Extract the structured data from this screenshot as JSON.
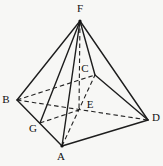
{
  "figure": {
    "type": "geometry-diagram",
    "canvas": {
      "width": 163,
      "height": 166,
      "background": "#f7f7f5"
    },
    "stroke": {
      "color": "#1d1d1d",
      "solid_width": 1.4,
      "dashed_width": 1.1,
      "dash_pattern": "4.5 3"
    },
    "vertices": {
      "F": {
        "label": "F",
        "x": 80,
        "y": 21,
        "lx": 80,
        "ly": 8
      },
      "B": {
        "label": "B",
        "x": 17,
        "y": 100,
        "lx": 6,
        "ly": 99
      },
      "A": {
        "label": "A",
        "x": 62,
        "y": 146,
        "lx": 61,
        "ly": 156
      },
      "D": {
        "label": "D",
        "x": 148,
        "y": 120,
        "lx": 156,
        "ly": 117
      },
      "C": {
        "label": "C",
        "x": 95,
        "y": 75,
        "lx": 85,
        "ly": 68
      },
      "E": {
        "label": "E",
        "x": 79,
        "y": 110,
        "lx": 90,
        "ly": 104
      },
      "G": {
        "label": "G",
        "x": 40,
        "y": 123,
        "lx": 33,
        "ly": 128
      }
    },
    "edges": {
      "solid": [
        [
          "F",
          "B"
        ],
        [
          "F",
          "G"
        ],
        [
          "F",
          "A"
        ],
        [
          "F",
          "C"
        ],
        [
          "F",
          "D"
        ],
        [
          "B",
          "A"
        ],
        [
          "A",
          "D"
        ],
        [
          "C",
          "D"
        ]
      ],
      "dashed": [
        [
          "B",
          "C"
        ],
        [
          "B",
          "D"
        ],
        [
          "A",
          "C"
        ],
        [
          "F",
          "E"
        ],
        [
          "G",
          "E"
        ]
      ]
    },
    "dots": [
      "F",
      "A"
    ]
  }
}
